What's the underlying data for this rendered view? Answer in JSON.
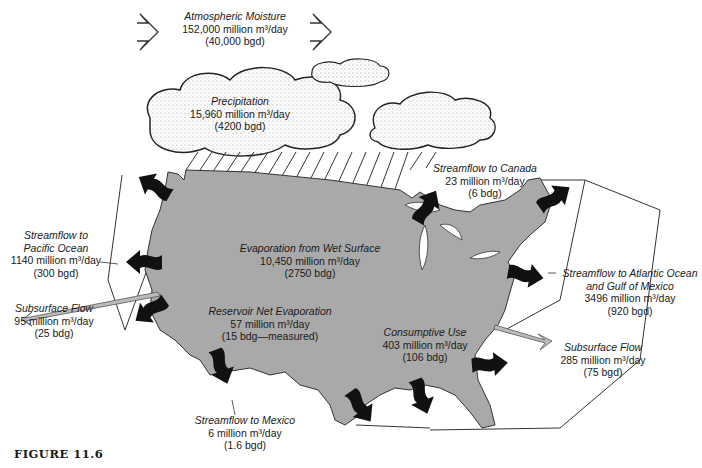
{
  "figure": {
    "caption": "FIGURE 11.6",
    "colors": {
      "land": "#a9a9a9",
      "arrow_dark": "#111111",
      "arrow_light": "#b8b8b8",
      "outline": "#222222",
      "background": "#ffffff"
    }
  },
  "labels": {
    "atmospheric_moisture": {
      "title": "Atmospheric Moisture",
      "value": "152,000 million m³/day",
      "alt": "(40,000 bgd)"
    },
    "precipitation": {
      "title": "Precipitation",
      "value": "15,960 million m³/day",
      "alt": "(4200 bgd)"
    },
    "streamflow_canada": {
      "title": "Streamflow to Canada",
      "value": "23 million m³/day",
      "alt": "(6 bdg)"
    },
    "streamflow_pacific": {
      "title1": "Streamflow to",
      "title2": "Pacific Ocean",
      "value": "1140 million m³/day",
      "alt": "(300 bgd)"
    },
    "subsurface_west": {
      "title": "Subsurface Flow",
      "value": "95 million m³/day",
      "alt": "(25 bdg)"
    },
    "evaporation_wet": {
      "title": "Evaporation from Wet Surface",
      "value": "10,450 million m³/day",
      "alt": "(2750 bdg)"
    },
    "reservoir_evap": {
      "title": "Reservoir Net Evaporation",
      "value": "57 million m³/day",
      "alt": "(15 bdg—measured)"
    },
    "streamflow_atlantic": {
      "title1": "Streamflow to Atlantic Ocean",
      "title2": "and Gulf of Mexico",
      "value": "3496 million m³/day",
      "alt": "(920 bgd)"
    },
    "consumptive_use": {
      "title": "Consumptive Use",
      "value": "403 million m³/day",
      "alt": "(106 bdg)"
    },
    "subsurface_east": {
      "title": "Subsurface Flow",
      "value": "285 million m³/day",
      "alt": "(75 bgd)"
    },
    "streamflow_mexico": {
      "title": "Streamflow to Mexico",
      "value": "6 million m³/day",
      "alt": "(1.6 bgd)"
    }
  },
  "icons": [
    "open-chevron-arrow",
    "cloud",
    "rain-lines",
    "us-map",
    "wavy-flow-arrow",
    "subsurface-arrow"
  ]
}
